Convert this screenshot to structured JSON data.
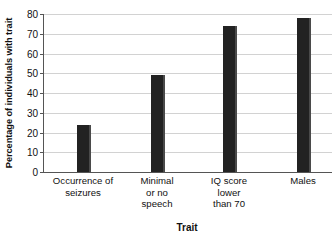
{
  "chart_data": {
    "type": "bar",
    "title": "",
    "xlabel": "Trait",
    "ylabel": "Percentage of individuals with trait",
    "categories": [
      "Occurrence of\nseizures",
      "Minimal\nor no\nspeech",
      "IQ score\nlower\nthan 70",
      "Males"
    ],
    "category_lines": [
      [
        "Occurrence of",
        "seizures"
      ],
      [
        "Minimal",
        "or no",
        "speech"
      ],
      [
        "IQ score",
        "lower",
        "than 70"
      ],
      [
        "Males"
      ]
    ],
    "values": [
      24,
      49,
      74,
      78
    ],
    "ylim": [
      0,
      80
    ],
    "ytick_labels": [
      "0",
      "10",
      "20",
      "30",
      "40",
      "50",
      "60",
      "70",
      "80"
    ],
    "ytick_values": [
      0,
      10,
      20,
      30,
      40,
      50,
      60,
      70,
      80
    ],
    "grid": true,
    "legend": "none",
    "colors": {
      "bar_fill": "#222222",
      "bar_edge": "#4a4a4a",
      "gridline": "#d2d2d2",
      "axis": "#555555",
      "background": "#ffffff",
      "text": "#111111"
    }
  }
}
